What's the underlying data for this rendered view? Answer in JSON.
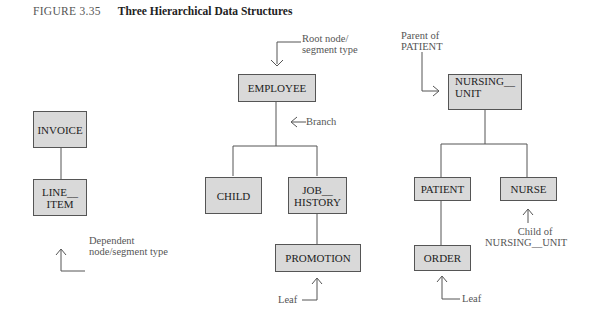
{
  "figure": {
    "number": "FIGURE 3.35",
    "title": "Three Hierarchical Data Structures"
  },
  "trees": [
    {
      "nodes": {
        "invoice": "INVOICE",
        "line_item_1": "LINE__",
        "line_item_2": "ITEM"
      },
      "annotations": {
        "dependent_1": "Dependent",
        "dependent_2": "node/segment type"
      }
    },
    {
      "nodes": {
        "employee": "EMPLOYEE",
        "child": "CHILD",
        "job_history_1": "JOB__",
        "job_history_2": "HISTORY",
        "promotion": "PROMOTION"
      },
      "annotations": {
        "root_1": "Root node/",
        "root_2": "segment type",
        "branch": "Branch",
        "leaf": "Leaf"
      }
    },
    {
      "nodes": {
        "nursing_unit_1": "NURSING__",
        "nursing_unit_2": "UNIT",
        "patient": "PATIENT",
        "nurse": "NURSE",
        "order": "ORDER"
      },
      "annotations": {
        "parent_1": "Parent of",
        "parent_2": "PATIENT",
        "child_of_1": "Child of",
        "child_of_2": "NURSING__UNIT",
        "leaf": "Leaf"
      }
    }
  ]
}
